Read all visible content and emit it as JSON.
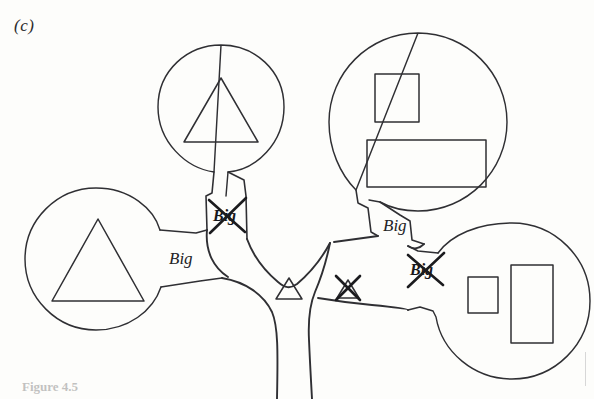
{
  "figure": {
    "panel_label": "(c)",
    "caption": "Figure 4.5",
    "background_color": "#fdfdfb",
    "ink_color": "#2f2f33"
  },
  "nodes": [
    {
      "id": "top-left-balloon",
      "name": "balloon-node-top-left",
      "cx": 221,
      "cy": 108,
      "r": 63,
      "contents": [
        {
          "shape": "triangle",
          "size": "large",
          "cx": 221,
          "cy": 110,
          "w": 74,
          "h": 64
        }
      ]
    },
    {
      "id": "top-right-balloon",
      "name": "balloon-node-top-right",
      "cx": 418,
      "cy": 122,
      "r": 89,
      "contents": [
        {
          "shape": "square",
          "size": "small",
          "x": 375,
          "y": 74,
          "w": 44,
          "h": 48
        },
        {
          "shape": "rectangle",
          "size": "wide",
          "x": 367,
          "y": 140,
          "w": 119,
          "h": 47
        }
      ]
    },
    {
      "id": "left-balloon",
      "name": "balloon-node-left",
      "cx": 96,
      "cy": 259,
      "r": 71,
      "contents": [
        {
          "shape": "triangle",
          "size": "large",
          "cx": 98,
          "cy": 260,
          "w": 92,
          "h": 82
        }
      ]
    },
    {
      "id": "bottom-right-balloon",
      "name": "balloon-node-bottom-right",
      "cx": 512,
      "cy": 301,
      "r": 78,
      "contents": [
        {
          "shape": "square",
          "size": "small",
          "x": 468,
          "y": 277,
          "w": 30,
          "h": 36
        },
        {
          "shape": "rectangle",
          "size": "tall",
          "x": 511,
          "y": 265,
          "w": 42,
          "h": 78
        }
      ]
    }
  ],
  "labels": [
    {
      "id": "label-left-stem",
      "name": "stem-label-left",
      "text": "Big",
      "x": 172,
      "y": 258,
      "struck_out": false
    },
    {
      "id": "label-top-left-stem",
      "name": "stem-label-top-left",
      "text": "Big",
      "x": 225,
      "y": 216,
      "struck_out": true
    },
    {
      "id": "label-top-right-stem",
      "name": "stem-label-top-right",
      "text": "Big",
      "x": 389,
      "y": 226,
      "struck_out": false
    },
    {
      "id": "label-bottom-right-stem",
      "name": "stem-label-bottom-right",
      "text": "Big",
      "x": 421,
      "y": 270,
      "struck_out": true
    }
  ],
  "center_marks": [
    {
      "id": "mark-small-triangle",
      "name": "small-triangle-mark",
      "shape": "triangle",
      "cx": 289,
      "cy": 288,
      "w": 26,
      "h": 21,
      "struck_out": false
    },
    {
      "id": "mark-struck-triangle",
      "name": "struck-triangle-mark",
      "shape": "triangle",
      "cx": 348,
      "cy": 289,
      "w": 22,
      "h": 19,
      "struck_out": true
    }
  ]
}
